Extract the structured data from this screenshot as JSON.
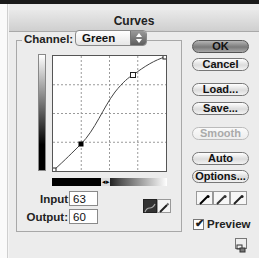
{
  "window": {
    "title": "Curves"
  },
  "channel": {
    "label": "Channel:",
    "value": "Green"
  },
  "curve": {
    "points": [
      {
        "input": 0,
        "output": 0,
        "selected": false
      },
      {
        "input": 63,
        "output": 60,
        "selected": true
      },
      {
        "input": 179,
        "output": 213,
        "selected": false
      },
      {
        "input": 255,
        "output": 255,
        "selected": false
      }
    ],
    "grid_divisions": 4
  },
  "fields": {
    "input_label": "Input:",
    "input_value": "63",
    "output_label": "Output:",
    "output_value": "60"
  },
  "modes": {
    "curve_icon": "curve-mode-icon",
    "pencil_icon": "pencil-mode-icon",
    "active": "curve"
  },
  "buttons": {
    "ok": "OK",
    "cancel": "Cancel",
    "load": "Load...",
    "save": "Save...",
    "smooth": "Smooth",
    "auto": "Auto",
    "options": "Options..."
  },
  "eyedroppers": [
    "black-point-eyedropper-icon",
    "gray-point-eyedropper-icon",
    "white-point-eyedropper-icon"
  ],
  "preview": {
    "label": "Preview",
    "checked": true
  },
  "gradient_toggle": "◂▸"
}
